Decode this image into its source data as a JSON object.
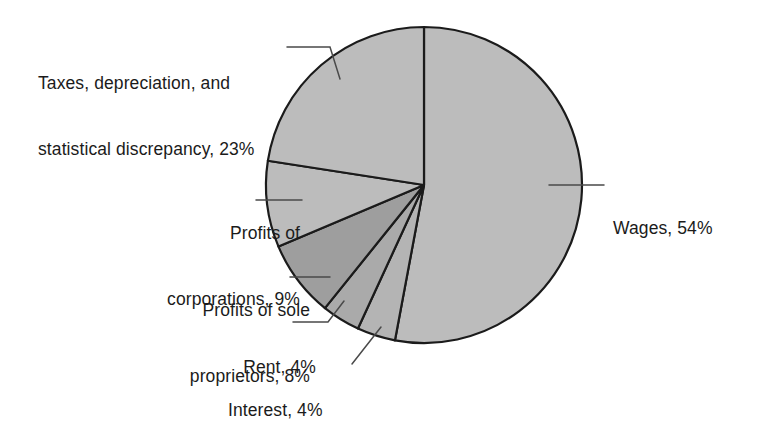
{
  "chart_data": {
    "type": "pie",
    "title": "",
    "subtitle": "",
    "xlabel": "",
    "ylabel": "",
    "legend_position": "none",
    "grid": false,
    "units": "percent",
    "total_labeled_percent": 102,
    "start_angle_deg": 0,
    "direction": "clockwise",
    "categories": [
      "Wages",
      "Interest",
      "Rent",
      "Profits of sole proprietors",
      "Profits of corporations",
      "Taxes, depreciation, and statistical discrepancy"
    ],
    "values": [
      54,
      4,
      4,
      8,
      9,
      23
    ],
    "slices": [
      {
        "name": "wages",
        "label": "Wages, 54%",
        "label_lines": [
          "Wages, 54%"
        ],
        "value": 54,
        "color": "#bcbcbc",
        "stroke": "#1b1b1b"
      },
      {
        "name": "interest",
        "label": "Interest, 4%",
        "label_lines": [
          "Interest, 4%"
        ],
        "value": 4,
        "color": "#b4b4b4",
        "stroke": "#1b1b1b"
      },
      {
        "name": "rent",
        "label": "Rent, 4%",
        "label_lines": [
          "Rent, 4%"
        ],
        "value": 4,
        "color": "#aaaaaa",
        "stroke": "#1b1b1b"
      },
      {
        "name": "profits-of-sole-proprietors",
        "label": "Profits of sole proprietors, 8%",
        "label_lines": [
          "Profits of sole",
          "proprietors, 8%"
        ],
        "value": 8,
        "color": "#9e9e9e",
        "stroke": "#1b1b1b"
      },
      {
        "name": "profits-of-corporations",
        "label": "Profits of corporations, 9%",
        "label_lines": [
          "Profits of",
          "corporations, 9%"
        ],
        "value": 9,
        "color": "#bcbcbc",
        "stroke": "#1b1b1b"
      },
      {
        "name": "taxes-depreciation-statistical-discrepancy",
        "label": "Taxes, depreciation, and statistical discrepancy, 23%",
        "label_lines": [
          "Taxes, depreciation, and",
          "statistical discrepancy, 23%"
        ],
        "value": 23,
        "color": "#bcbcbc",
        "stroke": "#1b1b1b"
      }
    ]
  },
  "labels": {
    "taxes_line1": "Taxes, depreciation, and",
    "taxes_line2": "statistical discrepancy, 23%",
    "corporations_line1": "Profits of",
    "corporations_line2": "corporations, 9%",
    "sole_line1": "Profits of sole",
    "sole_line2": "proprietors, 8%",
    "rent_line1": "Rent, 4%",
    "interest_line1": "Interest, 4%",
    "wages_line1": "Wages, 54%"
  },
  "style": {
    "background": "#ffffff",
    "outline": "#1b1b1b",
    "leader_line": "#4a4a4a",
    "text": "#1b1b1b"
  }
}
